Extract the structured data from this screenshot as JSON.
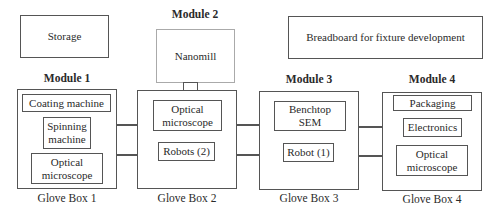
{
  "diagram": {
    "storage": "Storage",
    "breadboard": "Breadboard for fixture development",
    "modules": [
      {
        "label": "Module 1",
        "glovebox": "Glove Box 1",
        "items": [
          "Coating machine",
          "Spinning machine",
          "Optical microscope"
        ]
      },
      {
        "label": "Module 2",
        "glovebox": "Glove Box 2",
        "attached": "Nanomill",
        "items": [
          "Optical microscope",
          "Robots (2)"
        ]
      },
      {
        "label": "Module 3",
        "glovebox": "Glove Box 3",
        "items": [
          "Benchtop SEM",
          "Robot (1)"
        ]
      },
      {
        "label": "Module 4",
        "glovebox": "Glove Box 4",
        "items": [
          "Packaging",
          "Electronics",
          "Optical microscope"
        ]
      }
    ],
    "colors": {
      "line": "#555555",
      "nanomill_border": "#aaaaaa",
      "background": "#ffffff"
    }
  }
}
